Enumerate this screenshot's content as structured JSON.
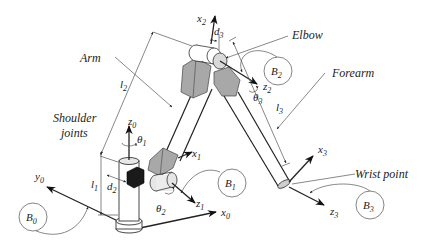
{
  "diagram": {
    "labels": {
      "arm": "Arm",
      "elbow": "Elbow",
      "forearm": "Forearm",
      "shoulder_line1": "Shoulder",
      "shoulder_line2": "joints",
      "wrist": "Wrist point"
    },
    "axes": {
      "x0": {
        "base": "x",
        "sub": "0"
      },
      "y0": {
        "base": "y",
        "sub": "0"
      },
      "z0": {
        "base": "z",
        "sub": "0"
      },
      "x1": {
        "base": "x",
        "sub": "1"
      },
      "z1": {
        "base": "z",
        "sub": "1"
      },
      "x2": {
        "base": "x",
        "sub": "2"
      },
      "z2": {
        "base": "z",
        "sub": "2"
      },
      "x3": {
        "base": "x",
        "sub": "3"
      },
      "z3": {
        "base": "z",
        "sub": "3"
      }
    },
    "angles": {
      "theta1": {
        "base": "θ",
        "sub": "1"
      },
      "theta2": {
        "base": "θ",
        "sub": "2"
      },
      "theta3": {
        "base": "θ",
        "sub": "3"
      }
    },
    "lengths": {
      "l1": {
        "base": "l",
        "sub": "1"
      },
      "l2": {
        "base": "l",
        "sub": "2"
      },
      "l3": {
        "base": "l",
        "sub": "3"
      },
      "d2": {
        "base": "d",
        "sub": "2"
      },
      "d3": {
        "base": "d",
        "sub": "3"
      }
    },
    "frames": {
      "B0": {
        "base": "B",
        "sub": "0"
      },
      "B1": {
        "base": "B",
        "sub": "1"
      },
      "B2": {
        "base": "B",
        "sub": "2"
      },
      "B3": {
        "base": "B",
        "sub": "3"
      }
    },
    "colors": {
      "link_gray": "#a8a8a8",
      "joint_dark": "#1a1a1a",
      "joint_light": "#dcdcdc",
      "line": "#222222"
    }
  }
}
